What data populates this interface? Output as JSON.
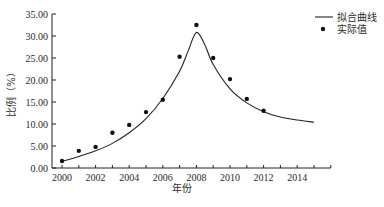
{
  "chart_data": {
    "type": "line",
    "title": "",
    "xlabel": "年份",
    "ylabel": "比例（%）",
    "xlim": [
      2000,
      2016
    ],
    "ylim": [
      0,
      35
    ],
    "x_ticks": [
      "2000",
      "2002",
      "2004",
      "2006",
      "2008",
      "2010",
      "2012",
      "2014"
    ],
    "y_ticks": [
      "0.00",
      "5.00",
      "10.00",
      "15.00",
      "20.00",
      "25.00",
      "30.00",
      "35.00"
    ],
    "grid": false,
    "legend_position": "top-right",
    "legend": [
      "拟合曲线",
      "实际值"
    ],
    "series": [
      {
        "name": "拟合曲线",
        "style": "line",
        "x": [
          2000,
          2001,
          2002,
          2003,
          2004,
          2005,
          2006,
          2007,
          2007.5,
          2008,
          2008.5,
          2009,
          2010,
          2011,
          2012,
          2013,
          2014,
          2015
        ],
        "values": [
          1.5,
          2.6,
          3.9,
          5.6,
          8.0,
          11.2,
          15.8,
          22.0,
          26.5,
          30.8,
          28.0,
          23.5,
          18.0,
          14.8,
          12.8,
          11.6,
          10.9,
          10.4
        ]
      },
      {
        "name": "实际值",
        "style": "scatter",
        "x": [
          2000,
          2001,
          2002,
          2003,
          2004,
          2005,
          2006,
          2007,
          2008,
          2009,
          2010,
          2011,
          2012
        ],
        "values": [
          1.6,
          3.9,
          4.8,
          8.0,
          9.8,
          12.7,
          15.5,
          25.3,
          32.5,
          25.0,
          20.2,
          15.7,
          13.0
        ]
      }
    ]
  },
  "legend": {
    "fit_label": "拟合曲线",
    "actual_label": "实际值"
  },
  "axes": {
    "x_title": "年份",
    "y_title": "比例（%）"
  }
}
